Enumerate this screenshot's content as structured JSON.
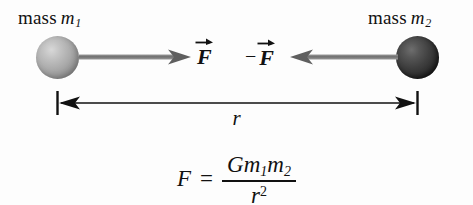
{
  "figure": {
    "background_color": "#fdfdfd",
    "ink_color": "#111111",
    "arrow_color": "#6b6b6b"
  },
  "masses": [
    {
      "id": "m1",
      "label_prefix": "mass",
      "symbol": "m",
      "subscript": "1",
      "sphere_shade": "light-gray",
      "color": "#ababab",
      "center_x": 58,
      "center_y": 57,
      "radius": 21
    },
    {
      "id": "m2",
      "label_prefix": "mass",
      "symbol": "m",
      "subscript": "2",
      "sphere_shade": "dark-gray",
      "color": "#3f3f3f",
      "center_x": 418,
      "center_y": 57,
      "radius": 21
    }
  ],
  "forces": [
    {
      "id": "force-on-m1",
      "sign": "",
      "symbol": "F",
      "notation": "vector",
      "direction": "right",
      "label_text": "F",
      "origin_x": 79,
      "tip_x": 190,
      "y": 57
    },
    {
      "id": "force-on-m2",
      "sign": "−",
      "symbol": "F",
      "notation": "vector",
      "direction": "left",
      "label_text": "−F",
      "origin_x": 396,
      "tip_x": 288,
      "y": 57
    }
  ],
  "distance": {
    "label": "r",
    "style": "double-headed-arrow-with-end-ticks",
    "left_x": 57,
    "right_x": 418,
    "y": 103,
    "tick_half_height": 11
  },
  "equation": {
    "lhs": "F",
    "equals": "=",
    "numerator": {
      "constant": "G",
      "mass1_symbol": "m",
      "mass1_subscript": "1",
      "mass2_symbol": "m",
      "mass2_subscript": "2",
      "plain": "Gm1m2"
    },
    "denominator": {
      "symbol": "r",
      "exponent": "2",
      "plain": "r2"
    },
    "plain": "F = Gm1m2 / r^2"
  }
}
